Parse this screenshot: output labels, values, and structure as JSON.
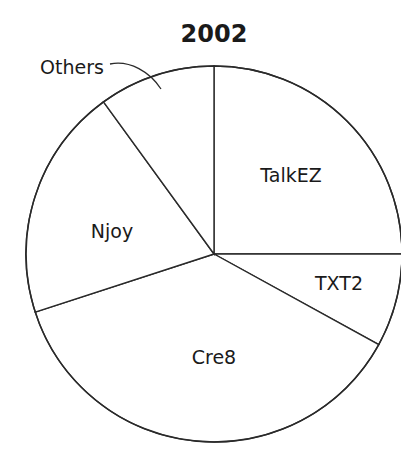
{
  "chart_data": {
    "type": "pie",
    "title": "2002",
    "categories": [
      "TalkEZ",
      "TXT2",
      "Cre8",
      "Njoy",
      "Others"
    ],
    "values": [
      25,
      8,
      37,
      20,
      10
    ],
    "units": "percent (estimated from slice angles)",
    "start_angle": "12 o'clock",
    "direction": "clockwise",
    "legend": "none (labels inside slices; 'Others' labeled outside with leader line)",
    "colors": {
      "fill": "#ffffff",
      "stroke": "#2a2a2a",
      "text": "#1a1a1a"
    },
    "label_positions": {
      "TalkEZ": {
        "x": 291,
        "y": 176
      },
      "TXT2": {
        "x": 339,
        "y": 284
      },
      "Cre8": {
        "x": 214,
        "y": 358
      },
      "Njoy": {
        "x": 112,
        "y": 232
      },
      "Others": {
        "x": 72,
        "y": 68,
        "outside": true
      }
    }
  },
  "geometry": {
    "cx": 214,
    "cy": 254,
    "r": 188
  }
}
